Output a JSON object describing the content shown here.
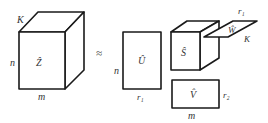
{
  "diagram": {
    "type": "tensor-decomposition",
    "operator": "≈",
    "tensor_Z": {
      "label": "Ẑ",
      "dims": {
        "depth": "K",
        "rows": "n",
        "cols": "m"
      }
    },
    "factor_U": {
      "label": "Û",
      "dims": {
        "rows": "n",
        "cols": "r₁"
      }
    },
    "core_S": {
      "label": "Ŝ"
    },
    "factor_W": {
      "label": "Ŵ",
      "dims": {
        "a": "r₁",
        "b": "K"
      }
    },
    "factor_V": {
      "label": "V̂",
      "dims": {
        "rows": "r₂",
        "cols": "m"
      }
    }
  }
}
